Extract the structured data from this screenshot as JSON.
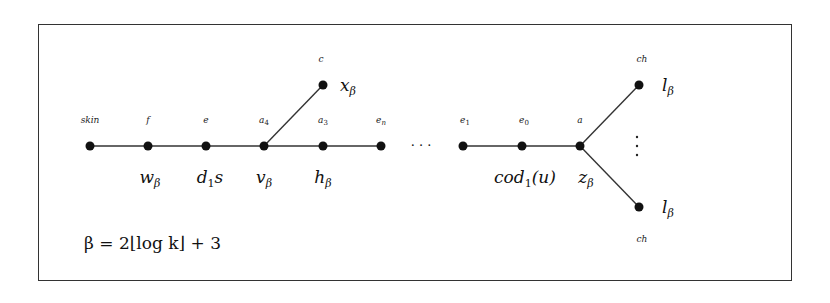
{
  "diagram": {
    "formula": "β = 2⌊log k⌋ + 3",
    "ellipsis_horizontal": "· · ·",
    "ellipsis_vertical": "⋮",
    "nodes": [
      {
        "id": "skin",
        "top_label": "skin",
        "bottom_label": "",
        "x": 90,
        "y": 146
      },
      {
        "id": "f",
        "top_label": "f",
        "bottom_label": "w",
        "bottom_sub": "β",
        "x": 148,
        "y": 146
      },
      {
        "id": "e",
        "top_label": "e",
        "bottom_label": "d",
        "bottom_sub": "1",
        "bottom_suffix": "s",
        "x": 206,
        "y": 146
      },
      {
        "id": "a4",
        "top_label": "a",
        "top_sub": "4",
        "bottom_label": "v",
        "bottom_sub": "β",
        "x": 264,
        "y": 146
      },
      {
        "id": "a3",
        "top_label": "a",
        "top_sub": "3",
        "bottom_label": "h",
        "bottom_sub": "β",
        "x": 323,
        "y": 146
      },
      {
        "id": "en",
        "top_label": "e",
        "top_sub": "n",
        "bottom_label": "",
        "x": 381,
        "y": 146
      },
      {
        "id": "e1",
        "top_label": "e",
        "top_sub": "1",
        "bottom_label": "",
        "x": 463,
        "y": 146
      },
      {
        "id": "e0",
        "top_label": "e",
        "top_sub": "0",
        "bottom_label": "cod",
        "bottom_sub": "1",
        "bottom_suffix": "(u)",
        "x": 522,
        "y": 146
      },
      {
        "id": "a",
        "top_label": "a",
        "bottom_label": "z",
        "bottom_sub": "β",
        "x": 580,
        "y": 146
      },
      {
        "id": "c",
        "top_label": "c",
        "side_label": "x",
        "side_sub": "β",
        "x": 323,
        "y": 85
      },
      {
        "id": "ch_top",
        "top_label": "ch",
        "side_label": "l",
        "side_sub": "β",
        "x": 639,
        "y": 85
      },
      {
        "id": "ch_bottom",
        "bottom_label": "ch",
        "side_label": "l",
        "side_sub": "β",
        "x": 639,
        "y": 207
      }
    ],
    "edges": [
      [
        "skin",
        "f"
      ],
      [
        "f",
        "e"
      ],
      [
        "e",
        "a4"
      ],
      [
        "a4",
        "a3"
      ],
      [
        "a3",
        "en"
      ],
      [
        "a4",
        "c"
      ],
      [
        "e1",
        "e0"
      ],
      [
        "e0",
        "a"
      ],
      [
        "a",
        "ch_top"
      ],
      [
        "a",
        "ch_bottom"
      ]
    ],
    "labels": {
      "skin": "skin",
      "f": "f",
      "e": "e",
      "a": "a",
      "c": "c",
      "ch": "ch",
      "sub_4": "4",
      "sub_3": "3",
      "sub_n": "n",
      "sub_1": "1",
      "sub_0": "0",
      "w": "w",
      "d": "d",
      "s": "s",
      "v": "v",
      "h": "h",
      "cod": "cod",
      "u_paren": "(u)",
      "z": "z",
      "x": "x",
      "l": "l",
      "beta": "β"
    }
  }
}
